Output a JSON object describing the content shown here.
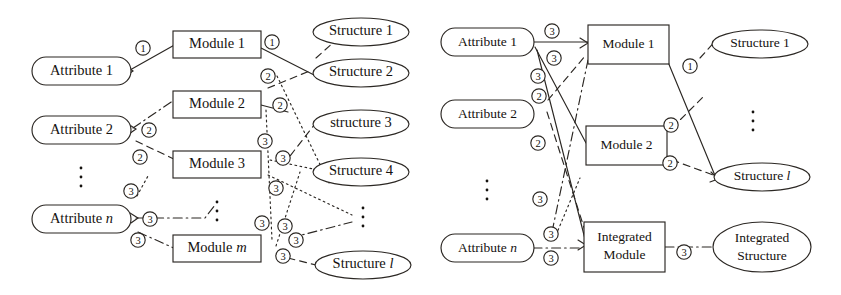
{
  "figure": {
    "panels": [
      {
        "id": "left",
        "name": "before-integration",
        "attributes": [
          {
            "label": "Attribute 1",
            "italic_tail": ""
          },
          {
            "label": "Attribute 2",
            "italic_tail": ""
          },
          {
            "label": "Attribute ",
            "italic_tail": "n"
          }
        ],
        "ellipsis_label": "⋮",
        "modules": [
          {
            "label": "Module 1",
            "italic_tail": ""
          },
          {
            "label": "Module 2",
            "italic_tail": ""
          },
          {
            "label": "Module 3",
            "italic_tail": ""
          },
          {
            "label": "Module ",
            "italic_tail": "m"
          }
        ],
        "module_ellipsis_label": "⋮",
        "structures": [
          {
            "label": "Structure 1",
            "italic_tail": ""
          },
          {
            "label": "Structure 2",
            "italic_tail": ""
          },
          {
            "label": "structure 3",
            "italic_tail": ""
          },
          {
            "label": "Structure 4",
            "italic_tail": ""
          },
          {
            "label": "Structure ",
            "italic_tail": "l"
          }
        ],
        "structure_ellipsis_label": "⋮",
        "edge_markers": [
          "1",
          "1",
          "2",
          "2",
          "2",
          "2",
          "3",
          "3",
          "3",
          "3",
          "3",
          "3",
          "3",
          "3",
          "3",
          "3",
          "3",
          "3"
        ]
      },
      {
        "id": "right",
        "name": "after-integration",
        "attributes": [
          {
            "label": "Attribute 1",
            "italic_tail": ""
          },
          {
            "label": "Attribute 2",
            "italic_tail": ""
          },
          {
            "label": "Attribute ",
            "italic_tail": "n"
          }
        ],
        "ellipsis_label": "⋮",
        "modules": [
          {
            "label": "Module 1",
            "italic_tail": ""
          },
          {
            "label": "Module 2",
            "italic_tail": ""
          },
          {
            "label_line1": "Integrated",
            "label_line2": "Module"
          }
        ],
        "structures": [
          {
            "label": "Structure 1",
            "italic_tail": ""
          },
          {
            "label": "Structure ",
            "italic_tail": "l"
          },
          {
            "label_line1": "Integrated",
            "label_line2": "Structure"
          }
        ],
        "structure_ellipsis_label": "⋮",
        "edge_markers": [
          "3",
          "3",
          "3",
          "2",
          "2",
          "3",
          "3",
          "3",
          "1",
          "2",
          "2",
          "3"
        ]
      }
    ],
    "colors": {
      "stroke": "#2b2723",
      "text": "#15120f",
      "background": "#ffffff"
    }
  }
}
